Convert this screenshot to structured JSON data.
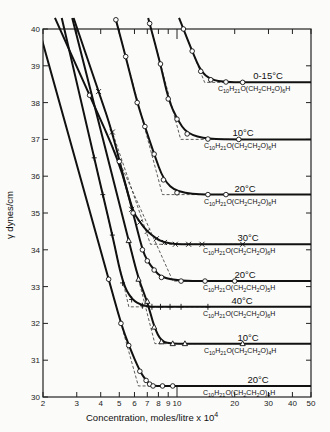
{
  "chart_data": {
    "type": "line",
    "title": "",
    "xlabel": "Concentration,   moles/litre x 10⁴",
    "ylabel": "γ   dynes/cm",
    "xscale": "log",
    "xlim": [
      2,
      50
    ],
    "ylim": [
      30,
      40
    ],
    "grid": false,
    "legend": "inline labels on each curve",
    "x_ticks": [
      2,
      3,
      4,
      5,
      6,
      7,
      8,
      9,
      10,
      20,
      30,
      40,
      50
    ],
    "x_tick_labels": [
      "2",
      "3",
      "4",
      "5",
      "6",
      "7",
      "8",
      "9",
      "10",
      "20",
      "30",
      "40",
      "50"
    ],
    "y_ticks": [
      30,
      31,
      32,
      33,
      34,
      35,
      36,
      37,
      38,
      39,
      40
    ],
    "y_tick_labels": [
      "30",
      "31",
      "32",
      "33",
      "34",
      "35",
      "36",
      "37",
      "38",
      "39",
      "40"
    ],
    "series": [
      {
        "name": "0-15°C",
        "formula": "C10H21O(CH2CH2O)6H",
        "marker": "circle",
        "cmc": 15.2,
        "plateau": 38.55,
        "x": [
          10.8,
          12.0,
          13.3,
          15.0,
          18.0,
          22.0
        ],
        "y": [
          40.0,
          39.4,
          38.85,
          38.62,
          38.56,
          38.55
        ]
      },
      {
        "name": "10°C",
        "formula": "C10H21O(CH2CH2O)6H",
        "marker": "circle",
        "cmc": 11.7,
        "plateau": 37.0,
        "x": [
          7.2,
          8.2,
          9.0,
          10.0,
          11.3,
          14.5,
          21.0
        ],
        "y": [
          40.15,
          39.05,
          38.1,
          37.55,
          37.15,
          37.01,
          37.0
        ]
      },
      {
        "name": "20°C",
        "formula": "C10H21O(CH2CH2O)6H",
        "marker": "circle",
        "cmc": 8.5,
        "plateau": 35.5,
        "x": [
          4.8,
          5.4,
          6.2,
          6.8,
          7.6,
          8.5,
          10.0,
          14.5,
          18.0
        ],
        "y": [
          40.25,
          39.25,
          38.0,
          37.35,
          36.6,
          35.9,
          35.55,
          35.5,
          35.5
        ]
      },
      {
        "name": "30°C",
        "formula": "C10H21O(CH2CH2O)6H",
        "marker": "x",
        "cmc": 7.2,
        "plateau": 34.15,
        "x": [
          3.9,
          4.6,
          5.8,
          6.4,
          7.0,
          7.8,
          8.6,
          9.8,
          11.5,
          13.5,
          22.0
        ],
        "y": [
          38.3,
          37.2,
          35.1,
          34.75,
          34.5,
          34.3,
          34.2,
          34.15,
          34.15,
          34.15,
          34.15
        ]
      },
      {
        "name": "20°C",
        "formula": "C10H21O(CH2CH2O)5H",
        "marker": "circle",
        "cmc": 7.6,
        "plateau": 33.15,
        "x": [
          3.5,
          5.0,
          5.9,
          6.6,
          7.0,
          7.6,
          8.3,
          10.5,
          14.0,
          20.0
        ],
        "y": [
          38.2,
          36.4,
          35.0,
          34.0,
          33.7,
          33.45,
          33.25,
          33.15,
          33.15,
          33.15
        ]
      },
      {
        "name": "40°C",
        "formula": "C10H21O(CH2CH2O)6H",
        "marker": "plus",
        "cmc": 5.8,
        "plateau": 32.45,
        "x": [
          3.7,
          4.1,
          4.6,
          5.2,
          5.8,
          6.6,
          7.4,
          8.2,
          9.2,
          10.5,
          14.5
        ],
        "y": [
          36.5,
          35.5,
          34.4,
          33.1,
          32.65,
          32.48,
          32.45,
          32.45,
          32.45,
          32.45,
          32.45
        ]
      },
      {
        "name": "10°C",
        "formula": "C10H21O(CH2CH2O)4H",
        "marker": "triangle",
        "cmc": 8.3,
        "plateau": 31.45,
        "x": [
          5.6,
          6.3,
          7.0,
          7.6,
          8.3,
          9.5,
          11.0,
          22.0
        ],
        "y": [
          34.25,
          33.2,
          32.6,
          31.9,
          31.5,
          31.45,
          31.45,
          31.45
        ]
      },
      {
        "name": "20°C",
        "formula": "C10H21O(CH2CH2O)4H",
        "marker": "circle",
        "cmc": 7.4,
        "plateau": 30.3,
        "x": [
          4.4,
          5.1,
          5.6,
          6.4,
          6.9,
          7.2,
          7.5,
          8.4,
          9.5
        ],
        "y": [
          33.2,
          32.0,
          31.4,
          30.7,
          30.45,
          30.35,
          30.3,
          30.3,
          30.3
        ]
      }
    ]
  },
  "labels": {
    "y_axis_title": "γ   dynes/cm",
    "x_axis_title": "Concentration,   moles/litre x 10",
    "x_axis_exp": "4",
    "curves": [
      {
        "temp": "0-15°C",
        "formula": "C10H21O(CH2CH2O)6H"
      },
      {
        "temp": "10°C",
        "formula": "C10H21O(CH2CH2O)6H"
      },
      {
        "temp": "20°C",
        "formula": "C10H21O(CH2CH2O)6H"
      },
      {
        "temp": "30°C",
        "formula": "C10H21O(CH2CH2O)6H"
      },
      {
        "temp": "20°C",
        "formula": "C10H21O(CH2CH2O)5H"
      },
      {
        "temp": "40°C",
        "formula": "C10H21O(CH2CH2O)6H"
      },
      {
        "temp": "10°C",
        "formula": "C10H21O(CH2CH2O)4H"
      },
      {
        "temp": "20°C",
        "formula": "C10H21O(CH2CH2O)4H"
      }
    ]
  }
}
